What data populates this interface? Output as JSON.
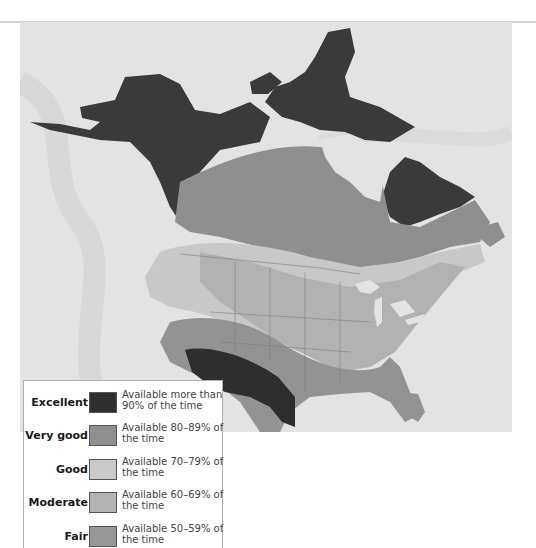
{
  "map": {
    "title": "",
    "background_color": "#e3e3e3",
    "region": "North America",
    "category_colors": {
      "excellent": "#3a3a3a",
      "very_good": "#8d8d8d",
      "good": "#c6c6c6",
      "moderate": "#b1b1b1",
      "fair": "#939393",
      "ocean": "#e3e3e3"
    }
  },
  "legend": {
    "items": [
      {
        "label": "Excellent",
        "description": "Available more than 90% of the time",
        "color": "#2e2e2e"
      },
      {
        "label": "Very good",
        "description": "Available 80–89% of the time",
        "color": "#8f8f8f"
      },
      {
        "label": "Good",
        "description": "Available 70–79% of the time",
        "color": "#cacaca"
      },
      {
        "label": "Moderate",
        "description": "Available 60–69% of the time",
        "color": "#b3b3b3"
      },
      {
        "label": "Fair",
        "description": "Available 50–59% of the time",
        "color": "#979797"
      }
    ]
  }
}
